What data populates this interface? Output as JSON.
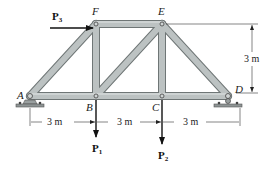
{
  "diagram": {
    "type": "truss",
    "joints": {
      "A": {
        "label": "A"
      },
      "B": {
        "label": "B"
      },
      "C": {
        "label": "C"
      },
      "D": {
        "label": "D"
      },
      "E": {
        "label": "E"
      },
      "F": {
        "label": "F"
      }
    },
    "members": [
      "AB",
      "BC",
      "CD",
      "AF",
      "FE",
      "ED",
      "FB",
      "EC",
      "BE"
    ],
    "supports": {
      "A": "pin",
      "D": "roller"
    },
    "loads": {
      "P1": {
        "label": "P",
        "subscript": "1",
        "joint": "B",
        "direction": "down"
      },
      "P2": {
        "label": "P",
        "subscript": "2",
        "joint": "C",
        "direction": "down"
      },
      "P3": {
        "label": "P",
        "subscript": "3",
        "joint": "F",
        "direction": "right"
      }
    },
    "dimensions": {
      "bottom": [
        "3 m",
        "3 m",
        "3 m"
      ],
      "height": "3 m"
    },
    "colors": {
      "member_fill": "#b9bfbf",
      "member_edge": "#6f7676",
      "support": "#8e9494",
      "ink": "#111111"
    }
  }
}
